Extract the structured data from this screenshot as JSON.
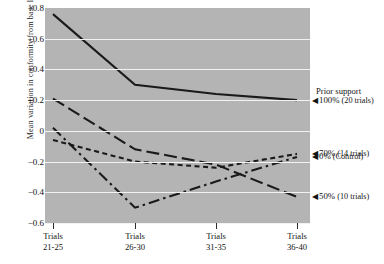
{
  "chart_data": {
    "type": "line",
    "title": "",
    "xlabel": "",
    "ylabel": "Mean variation in conformity from base level",
    "categories": [
      "Trials 21-25",
      "Trials 26-30",
      "Trials 31-35",
      "Trials 36-40"
    ],
    "category_lines": [
      [
        "Trials",
        "21-25"
      ],
      [
        "Trials",
        "26-30"
      ],
      [
        "Trials",
        "31-35"
      ],
      [
        "Trials",
        "36-40"
      ]
    ],
    "ylim": [
      -0.6,
      0.8
    ],
    "yticks": [
      0.8,
      0.6,
      0.4,
      0.2,
      0,
      -0.2,
      -0.4,
      -0.6
    ],
    "ytick_labels": [
      "+0.8",
      "+0.6",
      "+0.4",
      "+0.2",
      "0",
      "−0.2",
      "−0.4",
      "−0.6"
    ],
    "grid": true,
    "grid_color": "#f2f2f2",
    "plot_background": "#b4b4b4",
    "line_color": "#1a1a1a",
    "legend_position": "right",
    "series": [
      {
        "name": "100% (20 trials)",
        "style": "solid",
        "values": [
          0.76,
          0.3,
          0.24,
          0.2
        ]
      },
      {
        "name": "50% (10 trials)",
        "style": "long-dash",
        "values": [
          0.21,
          -0.12,
          -0.22,
          -0.43
        ]
      },
      {
        "name": "70% (14 trials)",
        "style": "short-dash",
        "values": [
          -0.06,
          -0.2,
          -0.24,
          -0.15
        ]
      },
      {
        "name": "0% (Control)",
        "style": "dash-dot",
        "values": [
          0.02,
          -0.5,
          -0.33,
          -0.17
        ]
      }
    ]
  },
  "legend": {
    "title": "Prior support",
    "arrow": "◀",
    "items": [
      {
        "pct": "100%",
        "note": "(20 trials)",
        "style": "solid"
      },
      {
        "pct": "50%",
        "note": "(10 trials)",
        "style": "long-dash"
      },
      {
        "pct": "70%",
        "note": "(14 trials)",
        "style": "short-dash"
      },
      {
        "pct": "0%",
        "note": "(Control)",
        "style": "dash-dot"
      }
    ]
  }
}
